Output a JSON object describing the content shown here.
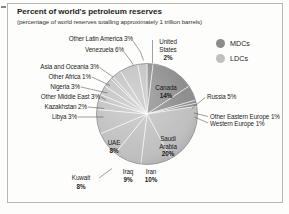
{
  "figure": {
    "title": "Percent of world's petroleum reserves",
    "subtitle": "(percentage of world reserves totalling approximately 1 trillion barrels)"
  },
  "legend": {
    "position": "top-right",
    "items": [
      {
        "label": "MDCs",
        "color": "#8c8c8c"
      },
      {
        "label": "LDCs",
        "color": "#c0c0c0"
      }
    ]
  },
  "labels": {
    "other_latin_america": "Other Latin America 3%",
    "venezuela": "Venezuela 6%",
    "united_states_l1": "United",
    "united_states_l2": "States",
    "united_states_l3": "2%",
    "asia_and_oceania": "Asia and Oceania 3%",
    "other_africa": "Other Africa 1%",
    "nigeria": "Nigeria 3%",
    "other_middle_east": "Other Middle East 3%",
    "kazakhstan": "Kazakhstan 2%",
    "libya": "Libya 3%",
    "russia": "Russia 5%",
    "other_eastern_europe": "Other Eastern Europe 1%",
    "western_europe": "Western Europe 1%",
    "kuwait_l1": "Kuwait",
    "kuwait_l2": "8%",
    "canada_l1": "Canada",
    "canada_l2": "14%",
    "saudi_l1": "Saudi",
    "saudi_l2": "Arabia",
    "saudi_l3": "20%",
    "uae_l1": "UAE",
    "uae_l2": "8%",
    "iraq_l1": "Iraq",
    "iraq_l2": "9%",
    "iran_l1": "Iran",
    "iran_l2": "10%"
  },
  "chart_data": {
    "type": "pie",
    "title": "Percent of world's petroleum reserves",
    "subtitle": "(percentage of world reserves totalling approximately 1 trillion barrels)",
    "unit": "percent of world reserves",
    "total_note": "approximately 1 trillion barrels",
    "legend_entries": [
      "MDCs",
      "LDCs"
    ],
    "categories": [
      "United States",
      "Canada",
      "Russia",
      "Other Eastern Europe",
      "Western Europe",
      "Saudi Arabia",
      "Iran",
      "Iraq",
      "UAE",
      "Kuwait",
      "Libya",
      "Kazakhstan",
      "Other Middle East",
      "Nigeria",
      "Other Africa",
      "Asia and Oceania",
      "Venezuela",
      "Other Latin America"
    ],
    "values": [
      2,
      14,
      5,
      1,
      1,
      20,
      10,
      9,
      8,
      8,
      3,
      2,
      3,
      3,
      1,
      3,
      6,
      3
    ],
    "groups": [
      "MDCs",
      "MDCs",
      "MDCs",
      "MDCs",
      "MDCs",
      "LDCs",
      "LDCs",
      "LDCs",
      "LDCs",
      "LDCs",
      "LDCs",
      "LDCs",
      "LDCs",
      "LDCs",
      "LDCs",
      "LDCs",
      "LDCs",
      "LDCs"
    ],
    "slices": [
      {
        "name": "United States",
        "value": 2,
        "group": "MDCs",
        "color": "#8c8c8c"
      },
      {
        "name": "Canada",
        "value": 14,
        "group": "MDCs",
        "color": "#8c8c8c"
      },
      {
        "name": "Russia",
        "value": 5,
        "group": "MDCs",
        "color": "#8c8c8c"
      },
      {
        "name": "Other Eastern Europe",
        "value": 1,
        "group": "MDCs",
        "color": "#8c8c8c"
      },
      {
        "name": "Western Europe",
        "value": 1,
        "group": "MDCs",
        "color": "#8c8c8c"
      },
      {
        "name": "Saudi Arabia",
        "value": 20,
        "group": "LDCs",
        "color": "#c0c0c0"
      },
      {
        "name": "Iran",
        "value": 10,
        "group": "LDCs",
        "color": "#c0c0c0"
      },
      {
        "name": "Iraq",
        "value": 9,
        "group": "LDCs",
        "color": "#c0c0c0"
      },
      {
        "name": "UAE",
        "value": 8,
        "group": "LDCs",
        "color": "#c0c0c0"
      },
      {
        "name": "Kuwait",
        "value": 8,
        "group": "LDCs",
        "color": "#c0c0c0"
      },
      {
        "name": "Libya",
        "value": 3,
        "group": "LDCs",
        "color": "#c0c0c0"
      },
      {
        "name": "Kazakhstan",
        "value": 2,
        "group": "LDCs",
        "color": "#c0c0c0"
      },
      {
        "name": "Other Middle East",
        "value": 3,
        "group": "LDCs",
        "color": "#c0c0c0"
      },
      {
        "name": "Nigeria",
        "value": 3,
        "group": "LDCs",
        "color": "#c0c0c0"
      },
      {
        "name": "Other Africa",
        "value": 1,
        "group": "LDCs",
        "color": "#c0c0c0"
      },
      {
        "name": "Asia and Oceania",
        "value": 3,
        "group": "LDCs",
        "color": "#c0c0c0"
      },
      {
        "name": "Venezuela",
        "value": 6,
        "group": "LDCs",
        "color": "#c0c0c0"
      },
      {
        "name": "Other Latin America",
        "value": 3,
        "group": "LDCs",
        "color": "#c0c0c0"
      }
    ],
    "start_angle_deg": -90,
    "direction": "clockwise",
    "legend_position": "top-right",
    "grid": false
  }
}
